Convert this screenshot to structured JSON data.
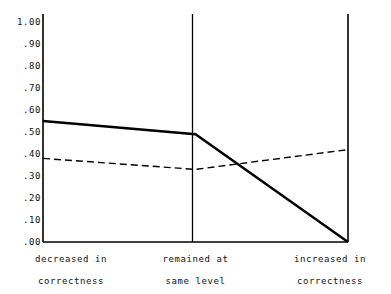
{
  "chart_data": {
    "type": "line",
    "title": "",
    "subtitle": "",
    "xlabel": "",
    "ylabel": "",
    "categories": [
      "decreased in correctness",
      "remained at same level",
      "increased in correctness"
    ],
    "category_lines": [
      [
        "decreased in",
        "correctness"
      ],
      [
        "remained at",
        "same level"
      ],
      [
        "increased in",
        "correctness"
      ]
    ],
    "series": [
      {
        "name": "solid",
        "style": "solid",
        "color": "#000000",
        "values": [
          0.55,
          0.49,
          0.0
        ]
      },
      {
        "name": "dashed",
        "style": "dashed",
        "color": "#000000",
        "values": [
          0.38,
          0.33,
          0.42
        ]
      }
    ],
    "ylim": [
      0.0,
      1.0
    ],
    "ytick_values": [
      0.0,
      0.1,
      0.2,
      0.3,
      0.4,
      0.5,
      0.6,
      0.7,
      0.8,
      0.9,
      1.0
    ],
    "ytick_labels": [
      ".00",
      ".10",
      ".20",
      ".30",
      ".40",
      ".50",
      ".60",
      ".70",
      ".80",
      ".90",
      "1.00"
    ],
    "grid": false,
    "vertical_rules": true,
    "legend": "none",
    "legend_position": "none",
    "axis_color": "#000000",
    "background_color": "#ffffff"
  }
}
